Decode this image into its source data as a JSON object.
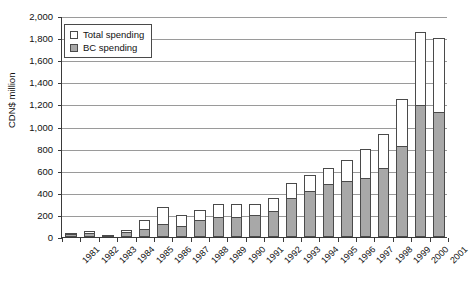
{
  "chart_data": {
    "type": "bar",
    "subtype": "stacked",
    "title": "",
    "xlabel": "",
    "ylabel": "CDN$ million",
    "ylim": [
      0,
      2000
    ],
    "ytick_step": 200,
    "ytick_labels": [
      "0",
      "200",
      "400",
      "600",
      "800",
      "1,000",
      "1,200",
      "1,400",
      "1,600",
      "1,800",
      "2,000"
    ],
    "grid": true,
    "legend_position": "top-left",
    "categories": [
      "1981",
      "1982",
      "1983",
      "1984",
      "1985",
      "1986",
      "1987",
      "1988",
      "1989",
      "1990",
      "1991",
      "1992",
      "1993",
      "1994",
      "1995",
      "1996",
      "1997",
      "1998",
      "1999",
      "2000",
      "2001"
    ],
    "series": [
      {
        "name": "Total spending",
        "color": "#ffffff",
        "values": [
          35,
          50,
          20,
          65,
          150,
          270,
          195,
          245,
          300,
          295,
          300,
          355,
          490,
          560,
          625,
          700,
          800,
          930,
          1245,
          1855,
          1800
        ]
      },
      {
        "name": "BC spending",
        "color": "#a8a8a8",
        "values": [
          30,
          40,
          15,
          45,
          70,
          120,
          100,
          150,
          185,
          185,
          195,
          235,
          350,
          420,
          480,
          510,
          530,
          625,
          820,
          1195,
          1130
        ]
      }
    ]
  },
  "legend": {
    "items": [
      {
        "label": "Total spending",
        "swatch": "white-square-icon"
      },
      {
        "label": "BC spending",
        "swatch": "gray-square-icon"
      }
    ]
  },
  "axes": {
    "y_title": "CDN$ million"
  }
}
